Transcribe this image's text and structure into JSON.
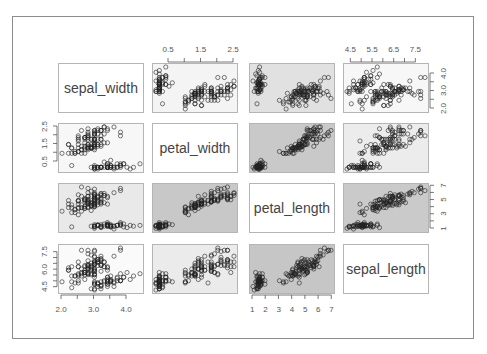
{
  "chart_data": {
    "type": "scatter",
    "title": "",
    "layout": "pairs-matrix 4x4",
    "variables": [
      "sepal_width",
      "petal_width",
      "petal_length",
      "sepal_length"
    ],
    "ranges": {
      "sepal_width": [
        2.0,
        4.4
      ],
      "petal_width": [
        0.1,
        2.5
      ],
      "petal_length": [
        1.0,
        6.9
      ],
      "sepal_length": [
        4.3,
        7.9
      ]
    },
    "axis_ticks": {
      "top_col2_petal_width": [
        "0.5",
        "1.5",
        "2.5"
      ],
      "top_col4_sepal_length": [
        "4.5",
        "5.5",
        "6.5",
        "7.5"
      ],
      "right_row1_sepal_width": [
        "2.0",
        "3.0",
        "4.0"
      ],
      "right_row3_petal_length": [
        "1",
        "3",
        "5",
        "7"
      ],
      "left_row2_petal_width": [
        "0.5",
        "1.5",
        "2.5"
      ],
      "left_row4_sepal_length": [
        "4.5",
        "6.0",
        "7.5"
      ],
      "bottom_col1_sepal_width": [
        "2.0",
        "3.0",
        "4.0"
      ],
      "bottom_col3_petal_length": [
        "1",
        "2",
        "3",
        "4",
        "5",
        "6",
        "7"
      ]
    },
    "panel_backgrounds": {
      "r1": [
        "label",
        "#f4f4f4",
        "#e1e1e1",
        "#f7f7f7"
      ],
      "r2": [
        "#f7f7f7",
        "label",
        "#c9c9c9",
        "#ececec"
      ],
      "r3": [
        "#e9e9e9",
        "#c8c8c8",
        "label",
        "#cacaca"
      ],
      "r4": [
        "#fafafa",
        "#ebebeb",
        "#c6c6c6",
        "label"
      ]
    },
    "grid": false,
    "legend": null,
    "species_groups": [
      "setosa",
      "versicolor",
      "virginica"
    ],
    "points": {
      "sepal_length": [
        5.1,
        4.9,
        4.7,
        4.6,
        5.0,
        5.4,
        4.6,
        5.0,
        4.4,
        4.9,
        5.4,
        4.8,
        4.8,
        4.3,
        5.8,
        5.7,
        5.4,
        5.1,
        5.7,
        5.1,
        5.4,
        5.1,
        4.6,
        5.1,
        4.8,
        5.0,
        5.0,
        5.2,
        5.2,
        4.7,
        4.8,
        5.4,
        5.2,
        5.5,
        4.9,
        5.0,
        5.5,
        4.9,
        4.4,
        5.1,
        5.0,
        4.5,
        4.4,
        5.0,
        5.1,
        4.8,
        5.1,
        4.6,
        5.3,
        5.0,
        7.0,
        6.4,
        6.9,
        5.5,
        6.5,
        5.7,
        6.3,
        4.9,
        6.6,
        5.2,
        5.0,
        5.9,
        6.0,
        6.1,
        5.6,
        6.7,
        5.6,
        5.8,
        6.2,
        5.6,
        5.9,
        6.1,
        6.3,
        6.1,
        6.4,
        6.6,
        6.8,
        6.7,
        6.0,
        5.7,
        5.5,
        5.5,
        5.8,
        6.0,
        5.4,
        6.0,
        6.7,
        6.3,
        5.6,
        5.5,
        5.5,
        6.1,
        5.8,
        5.0,
        5.6,
        5.7,
        5.7,
        6.2,
        5.1,
        5.7,
        6.3,
        5.8,
        7.1,
        6.3,
        6.5,
        7.6,
        4.9,
        7.3,
        6.7,
        7.2,
        6.5,
        6.4,
        6.8,
        5.7,
        5.8,
        6.4,
        6.5,
        7.7,
        7.7,
        6.0,
        6.9,
        5.6,
        7.7,
        6.3,
        6.7,
        7.2,
        6.2,
        6.1,
        6.4,
        7.2,
        7.4,
        7.9,
        6.4,
        6.3,
        6.1,
        7.7,
        6.3,
        6.4,
        6.0,
        6.9,
        6.7,
        6.9,
        5.8,
        6.8,
        6.7,
        6.7,
        6.3,
        6.5,
        6.2,
        5.9
      ],
      "sepal_width": [
        3.5,
        3.0,
        3.2,
        3.1,
        3.6,
        3.9,
        3.4,
        3.4,
        2.9,
        3.1,
        3.7,
        3.4,
        3.0,
        3.0,
        4.0,
        4.4,
        3.9,
        3.5,
        3.8,
        3.8,
        3.4,
        3.7,
        3.6,
        3.3,
        3.4,
        3.0,
        3.4,
        3.5,
        3.4,
        3.2,
        3.1,
        3.4,
        4.1,
        4.2,
        3.1,
        3.2,
        3.5,
        3.6,
        3.0,
        3.4,
        3.5,
        2.3,
        3.2,
        3.5,
        3.8,
        3.0,
        3.8,
        3.2,
        3.7,
        3.3,
        3.2,
        3.2,
        3.1,
        2.3,
        2.8,
        2.8,
        3.3,
        2.4,
        2.9,
        2.7,
        2.0,
        3.0,
        2.2,
        2.9,
        2.9,
        3.1,
        3.0,
        2.7,
        2.2,
        2.5,
        3.2,
        2.8,
        2.5,
        2.8,
        2.9,
        3.0,
        2.8,
        3.0,
        2.9,
        2.6,
        2.4,
        2.4,
        2.7,
        2.7,
        3.0,
        3.4,
        3.1,
        2.3,
        3.0,
        2.5,
        2.6,
        3.0,
        2.6,
        2.3,
        2.7,
        3.0,
        2.9,
        2.9,
        2.5,
        2.8,
        3.3,
        2.7,
        3.0,
        2.9,
        3.0,
        3.0,
        2.5,
        2.9,
        2.5,
        3.6,
        3.2,
        2.7,
        3.0,
        2.5,
        2.8,
        3.2,
        3.0,
        3.8,
        2.6,
        2.2,
        3.2,
        2.8,
        2.8,
        2.7,
        3.3,
        3.2,
        2.8,
        3.0,
        2.8,
        3.0,
        2.8,
        3.8,
        2.8,
        2.8,
        2.6,
        3.0,
        3.4,
        3.1,
        3.0,
        3.1,
        3.1,
        3.1,
        2.7,
        3.2,
        3.3,
        3.0,
        2.5,
        3.0,
        3.4,
        3.0
      ],
      "petal_length": [
        1.4,
        1.4,
        1.3,
        1.5,
        1.4,
        1.7,
        1.4,
        1.5,
        1.4,
        1.5,
        1.5,
        1.6,
        1.4,
        1.1,
        1.2,
        1.5,
        1.3,
        1.4,
        1.7,
        1.5,
        1.7,
        1.5,
        1.0,
        1.7,
        1.9,
        1.6,
        1.6,
        1.5,
        1.4,
        1.6,
        1.6,
        1.5,
        1.5,
        1.4,
        1.5,
        1.2,
        1.3,
        1.4,
        1.3,
        1.5,
        1.3,
        1.3,
        1.3,
        1.6,
        1.9,
        1.4,
        1.6,
        1.4,
        1.5,
        1.4,
        4.7,
        4.5,
        4.9,
        4.0,
        4.6,
        4.5,
        4.7,
        3.3,
        4.6,
        3.9,
        3.5,
        4.2,
        4.0,
        4.7,
        3.6,
        4.4,
        4.5,
        4.1,
        4.5,
        3.9,
        4.8,
        4.0,
        4.9,
        4.7,
        4.3,
        4.4,
        4.8,
        5.0,
        4.5,
        3.5,
        3.8,
        3.7,
        3.9,
        5.1,
        4.5,
        4.5,
        4.7,
        4.4,
        4.1,
        4.0,
        4.4,
        4.6,
        4.0,
        3.3,
        4.2,
        4.2,
        4.2,
        4.3,
        3.0,
        4.1,
        6.0,
        5.1,
        5.9,
        5.6,
        5.8,
        6.6,
        4.5,
        6.3,
        5.8,
        6.1,
        5.1,
        5.3,
        5.5,
        5.0,
        5.1,
        5.3,
        5.5,
        6.7,
        6.9,
        5.0,
        5.7,
        4.9,
        6.7,
        4.9,
        5.7,
        6.0,
        4.8,
        4.9,
        5.6,
        5.8,
        6.1,
        6.4,
        5.6,
        5.1,
        5.6,
        6.1,
        5.6,
        5.5,
        4.8,
        5.4,
        5.6,
        5.1,
        5.1,
        5.9,
        5.7,
        5.2,
        5.0,
        5.2,
        5.4,
        5.1
      ],
      "petal_width": [
        0.2,
        0.2,
        0.2,
        0.2,
        0.2,
        0.4,
        0.3,
        0.2,
        0.2,
        0.1,
        0.2,
        0.2,
        0.1,
        0.1,
        0.2,
        0.4,
        0.4,
        0.3,
        0.3,
        0.3,
        0.2,
        0.4,
        0.2,
        0.5,
        0.2,
        0.2,
        0.4,
        0.2,
        0.2,
        0.2,
        0.2,
        0.4,
        0.1,
        0.2,
        0.2,
        0.2,
        0.2,
        0.1,
        0.2,
        0.2,
        0.3,
        0.3,
        0.2,
        0.6,
        0.4,
        0.3,
        0.2,
        0.2,
        0.2,
        0.2,
        1.4,
        1.5,
        1.5,
        1.3,
        1.5,
        1.3,
        1.6,
        1.0,
        1.3,
        1.4,
        1.0,
        1.5,
        1.0,
        1.4,
        1.3,
        1.4,
        1.5,
        1.0,
        1.5,
        1.1,
        1.8,
        1.3,
        1.5,
        1.2,
        1.3,
        1.4,
        1.4,
        1.7,
        1.5,
        1.0,
        1.1,
        1.0,
        1.2,
        1.6,
        1.5,
        1.6,
        1.5,
        1.3,
        1.3,
        1.3,
        1.2,
        1.4,
        1.2,
        1.0,
        1.3,
        1.2,
        1.3,
        1.3,
        1.1,
        1.3,
        2.5,
        1.9,
        2.1,
        1.8,
        2.2,
        2.1,
        1.7,
        1.8,
        1.8,
        2.5,
        2.0,
        1.9,
        2.1,
        2.0,
        2.4,
        2.3,
        1.8,
        2.2,
        2.3,
        1.5,
        2.3,
        2.0,
        2.0,
        1.8,
        2.1,
        1.8,
        1.8,
        1.8,
        2.1,
        1.6,
        1.9,
        2.0,
        2.2,
        1.5,
        1.4,
        2.3,
        2.4,
        1.8,
        1.8,
        2.1,
        2.4,
        2.3,
        1.9,
        2.3,
        2.5,
        2.3,
        1.9,
        2.0,
        2.3,
        1.8
      ]
    }
  },
  "labels": {
    "v0": "sepal_width",
    "v1": "petal_width",
    "v2": "petal_length",
    "v3": "sepal_length"
  }
}
